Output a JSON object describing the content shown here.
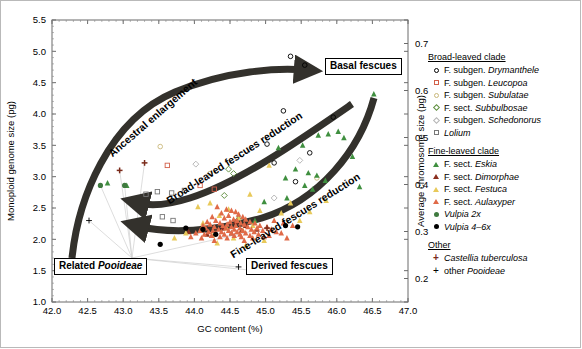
{
  "chart_data": {
    "type": "scatter",
    "title": "",
    "xlabel": "GC content (%)",
    "ylabel": "Monoploid genome size (pg)",
    "y2label": "Average chromosome size (pg)",
    "xlim": [
      42.0,
      47.0
    ],
    "ylim": [
      1.0,
      5.5
    ],
    "y2lim": [
      0.15,
      0.75
    ],
    "xticks": [
      "42.0",
      "42.5",
      "43.0",
      "43.5",
      "44.0",
      "44.5",
      "45.0",
      "45.5",
      "46.0",
      "46.5",
      "47.0"
    ],
    "yticks": [
      "1.0",
      "1.5",
      "2.0",
      "2.5",
      "3.0",
      "3.5",
      "4.0",
      "4.5",
      "5.0",
      "5.5"
    ],
    "y2ticks": [
      "0.2",
      "0.3",
      "0.4",
      "0.5",
      "0.6",
      "0.7"
    ],
    "grid": false,
    "legend_position": "right",
    "series": [
      {
        "name": "F. subgen. Drymanthele",
        "marker": "circle-open",
        "color": "#000000",
        "points": [
          [
            45.35,
            4.92
          ],
          [
            45.55,
            4.78
          ],
          [
            45.25,
            4.05
          ],
          [
            45.95,
            3.95
          ],
          [
            45.02,
            3.52
          ],
          [
            45.62,
            3.38
          ],
          [
            45.12,
            3.22
          ],
          [
            45.42,
            2.92
          ]
        ]
      },
      {
        "name": "F. subgen. Leucopoa",
        "marker": "square-open",
        "color": "#d2604a",
        "points": [
          [
            43.62,
            3.18
          ],
          [
            44.08,
            2.86
          ],
          [
            44.28,
            2.8
          ]
        ]
      },
      {
        "name": "F. subgen. Subulatae",
        "marker": "circle-open",
        "color": "#c9b87a",
        "points": [
          [
            43.52,
            3.48
          ],
          [
            44.22,
            3.05
          ],
          [
            45.72,
            2.98
          ]
        ]
      },
      {
        "name": "F. sect. Subbulbosae",
        "marker": "diamond-open",
        "color": "#5f8f3f",
        "points": [
          [
            44.48,
            3.12
          ],
          [
            44.55,
            3.05
          ],
          [
            44.42,
            2.7
          ]
        ]
      },
      {
        "name": "F. subgen. Schedonorus",
        "marker": "diamond-open",
        "color": "#b5b5b5",
        "points": [
          [
            44.02,
            3.2
          ],
          [
            45.48,
            3.26
          ],
          [
            45.12,
            2.66
          ]
        ]
      },
      {
        "name": "Lolium",
        "marker": "square-open",
        "color": "#777777",
        "points": [
          [
            43.32,
            2.72
          ],
          [
            43.48,
            2.76
          ],
          [
            43.68,
            2.74
          ],
          [
            43.86,
            2.78
          ],
          [
            43.55,
            2.36
          ],
          [
            43.7,
            2.3
          ]
        ]
      },
      {
        "name": "F. sect. Eskia",
        "marker": "triangle",
        "color": "#3f8f3f",
        "points": [
          [
            46.52,
            4.32
          ],
          [
            46.02,
            3.72
          ],
          [
            45.88,
            3.68
          ],
          [
            45.74,
            3.66
          ],
          [
            46.1,
            3.62
          ],
          [
            45.52,
            3.5
          ],
          [
            45.18,
            3.46
          ],
          [
            46.22,
            3.32
          ],
          [
            45.42,
            3.12
          ],
          [
            45.6,
            3.06
          ],
          [
            45.72,
            3.02
          ],
          [
            45.28,
            2.98
          ],
          [
            45.84,
            2.94
          ],
          [
            45.55,
            2.86
          ],
          [
            45.66,
            2.8
          ],
          [
            46.32,
            2.84
          ],
          [
            45.3,
            2.66
          ],
          [
            44.98,
            2.6
          ],
          [
            42.78,
            2.9
          ],
          [
            43.05,
            2.86
          ],
          [
            44.62,
            2.36
          ],
          [
            44.85,
            2.3
          ]
        ]
      },
      {
        "name": "F. sect. Dimorphae",
        "marker": "triangle",
        "color": "#8b2f1f",
        "points": [
          [
            44.58,
            2.28
          ],
          [
            44.72,
            2.22
          ],
          [
            44.4,
            2.18
          ],
          [
            44.66,
            2.14
          ],
          [
            44.52,
            2.1
          ],
          [
            44.88,
            2.16
          ],
          [
            43.92,
            2.12
          ],
          [
            44.18,
            2.08
          ]
        ]
      },
      {
        "name": "F. sect. Festuca",
        "marker": "triangle",
        "color": "#e8c95a",
        "points": [
          [
            45.05,
            3.18
          ],
          [
            44.78,
            2.72
          ],
          [
            44.22,
            2.58
          ],
          [
            44.05,
            2.52
          ],
          [
            44.48,
            2.48
          ],
          [
            44.92,
            2.46
          ],
          [
            45.22,
            2.42
          ],
          [
            44.35,
            2.38
          ],
          [
            44.62,
            2.34
          ],
          [
            45.48,
            2.3
          ],
          [
            44.12,
            2.26
          ],
          [
            44.82,
            2.22
          ],
          [
            44.45,
            2.18
          ],
          [
            44.68,
            2.14
          ],
          [
            43.88,
            2.1
          ],
          [
            44.25,
            2.06
          ],
          [
            44.55,
            2.02
          ],
          [
            44.98,
            1.98
          ],
          [
            44.32,
            1.94
          ],
          [
            44.72,
            1.9
          ],
          [
            45.35,
            2.58
          ],
          [
            45.62,
            2.44
          ],
          [
            45.85,
            2.62
          ],
          [
            43.72,
            2.02
          ]
        ]
      },
      {
        "name": "F. sect. Aulaxyper",
        "marker": "triangle",
        "color": "#e06a48",
        "points": [
          [
            44.32,
            2.52
          ],
          [
            44.45,
            2.48
          ],
          [
            44.52,
            2.46
          ],
          [
            44.58,
            2.44
          ],
          [
            44.38,
            2.42
          ],
          [
            44.62,
            2.4
          ],
          [
            44.48,
            2.38
          ],
          [
            44.25,
            2.36
          ],
          [
            44.68,
            2.36
          ],
          [
            44.42,
            2.34
          ],
          [
            44.55,
            2.32
          ],
          [
            44.72,
            2.32
          ],
          [
            44.3,
            2.3
          ],
          [
            44.6,
            2.3
          ],
          [
            44.18,
            2.28
          ],
          [
            44.5,
            2.28
          ],
          [
            44.78,
            2.28
          ],
          [
            44.36,
            2.26
          ],
          [
            44.65,
            2.26
          ],
          [
            44.85,
            2.26
          ],
          [
            44.22,
            2.24
          ],
          [
            44.46,
            2.24
          ],
          [
            44.7,
            2.24
          ],
          [
            44.12,
            2.22
          ],
          [
            44.4,
            2.22
          ],
          [
            44.58,
            2.22
          ],
          [
            44.92,
            2.22
          ],
          [
            44.28,
            2.2
          ],
          [
            44.52,
            2.2
          ],
          [
            44.75,
            2.2
          ],
          [
            45.02,
            2.2
          ],
          [
            44.16,
            2.18
          ],
          [
            44.44,
            2.18
          ],
          [
            44.64,
            2.18
          ],
          [
            44.88,
            2.18
          ],
          [
            44.34,
            2.16
          ],
          [
            44.56,
            2.16
          ],
          [
            44.8,
            2.16
          ],
          [
            45.08,
            2.16
          ],
          [
            44.08,
            2.14
          ],
          [
            44.26,
            2.14
          ],
          [
            44.48,
            2.14
          ],
          [
            44.68,
            2.14
          ],
          [
            44.96,
            2.14
          ],
          [
            44.2,
            2.12
          ],
          [
            44.38,
            2.12
          ],
          [
            44.6,
            2.12
          ],
          [
            44.84,
            2.12
          ],
          [
            45.15,
            2.12
          ],
          [
            44.02,
            2.1
          ],
          [
            44.3,
            2.1
          ],
          [
            44.52,
            2.1
          ],
          [
            44.72,
            2.1
          ],
          [
            45.22,
            2.1
          ],
          [
            44.14,
            2.08
          ],
          [
            44.42,
            2.08
          ],
          [
            44.64,
            2.08
          ],
          [
            44.9,
            2.08
          ],
          [
            44.24,
            2.06
          ],
          [
            44.56,
            2.06
          ],
          [
            44.78,
            2.06
          ],
          [
            45.05,
            2.06
          ],
          [
            43.95,
            2.04
          ],
          [
            44.36,
            2.04
          ],
          [
            44.66,
            2.04
          ],
          [
            44.98,
            2.04
          ],
          [
            44.1,
            2.02
          ],
          [
            44.46,
            2.02
          ],
          [
            44.82,
            2.02
          ],
          [
            45.3,
            2.02
          ],
          [
            44.28,
            1.98
          ],
          [
            44.7,
            1.98
          ],
          [
            45.12,
            2.3
          ],
          [
            45.25,
            2.26
          ],
          [
            45.38,
            2.22
          ]
        ]
      },
      {
        "name": "Vulpia 2x",
        "marker": "circle-filled",
        "color": "#3f7a3f",
        "points": [
          [
            42.68,
            2.86
          ],
          [
            43.02,
            2.86
          ]
        ]
      },
      {
        "name": "Vulpia 4-6x",
        "marker": "circle-filled",
        "color": "#000000",
        "points": [
          [
            43.52,
            1.92
          ],
          [
            43.88,
            2.18
          ],
          [
            44.12,
            2.16
          ],
          [
            44.3,
            2.08
          ],
          [
            45.28,
            2.22
          ],
          [
            45.45,
            2.2
          ]
        ]
      },
      {
        "name": "Castellia tuberculosa",
        "marker": "plus-bold",
        "color": "#7a2a1a",
        "points": [
          [
            42.95,
            3.1
          ],
          [
            43.3,
            3.22
          ],
          [
            45.02,
            2.18
          ]
        ]
      },
      {
        "name": "other Pooideae",
        "marker": "plus",
        "color": "#000000",
        "points": [
          [
            42.52,
            2.3
          ],
          [
            44.62,
            1.56
          ],
          [
            44.85,
            1.5
          ]
        ]
      }
    ],
    "annotations": [
      {
        "text": "Ancestral enlargement",
        "type": "arrow-label"
      },
      {
        "text": "Broad-leaved fescues reduction",
        "type": "arrow-label"
      },
      {
        "text": "Fine-leaved fescues reduction",
        "type": "arrow-label"
      }
    ],
    "callouts": [
      {
        "text": "Basal fescues"
      },
      {
        "text": "Related Pooideae"
      },
      {
        "text": "Derived fescues"
      }
    ]
  },
  "axes": {
    "x_title": "GC content (%)",
    "y_left_title": "Monoploid genome size (pg)",
    "y_right_title": "Average chromosome size (pg)",
    "x_ticks": [
      "42.0",
      "42.5",
      "43.0",
      "43.5",
      "44.0",
      "44.5",
      "45.0",
      "45.5",
      "46.0",
      "46.5",
      "47.0"
    ],
    "y_left_ticks": [
      "5.5",
      "5.0",
      "4.5",
      "4.0",
      "3.5",
      "3.0",
      "2.5",
      "2.0",
      "1.5",
      "1.0"
    ],
    "y_right_ticks": [
      "0.7",
      "0.6",
      "0.5",
      "0.4",
      "0.3",
      "0.2"
    ]
  },
  "callouts": {
    "basal": "Basal fescues",
    "related_prefix": "Related ",
    "related_italic": "Pooideae",
    "derived": "Derived fescues"
  },
  "arrows": {
    "ancestral": "Ancestral enlargement",
    "broad": "Broad-leaved fescues reduction",
    "fine": "Fine-leaved fescues reduction"
  },
  "legend": {
    "group1_title": "Broad-leaved clade",
    "group1": [
      {
        "label_prefix": "F. subgen. ",
        "label_italic": "Drymanthele",
        "marker": "circle-open",
        "color": "#000000"
      },
      {
        "label_prefix": "F. subgen. ",
        "label_italic": "Leucopoa",
        "marker": "square-open",
        "color": "#d2604a"
      },
      {
        "label_prefix": "F. subgen. ",
        "label_italic": "Subulatae",
        "marker": "circle-open",
        "color": "#c9b87a"
      },
      {
        "label_prefix": "F. sect. ",
        "label_italic": "Subbulbosae",
        "marker": "diamond-open",
        "color": "#5f8f3f"
      },
      {
        "label_prefix": "F. subgen. ",
        "label_italic": "Schedonorus",
        "marker": "diamond-open",
        "color": "#b5b5b5"
      },
      {
        "label_prefix": "",
        "label_italic": "Lolium",
        "marker": "square-open",
        "color": "#777777"
      }
    ],
    "group2_title": "Fine-leaved clade",
    "group2": [
      {
        "label_prefix": "F. sect. ",
        "label_italic": "Eskia",
        "marker": "triangle",
        "color": "#3f8f3f"
      },
      {
        "label_prefix": "F. sect. ",
        "label_italic": "Dimorphae",
        "marker": "triangle",
        "color": "#8b2f1f"
      },
      {
        "label_prefix": "F. sect. ",
        "label_italic": "Festuca",
        "marker": "triangle",
        "color": "#e8c95a"
      },
      {
        "label_prefix": "F. sect. ",
        "label_italic": "Aulaxyper",
        "marker": "triangle",
        "color": "#e06a48"
      },
      {
        "label_prefix": "",
        "label_italic": "Vulpia 2x",
        "marker": "circle-filled",
        "color": "#3f7a3f"
      },
      {
        "label_prefix": "",
        "label_italic": "Vulpia 4–6x",
        "marker": "circle-filled",
        "color": "#000000"
      }
    ],
    "group3_title": "Other",
    "group3": [
      {
        "label_prefix": "",
        "label_italic": "Castellia tuberculosa",
        "marker": "plus-bold",
        "color": "#7a2a1a"
      },
      {
        "label_prefix": "other ",
        "label_italic": "Pooideae",
        "marker": "plus",
        "color": "#000000"
      }
    ]
  }
}
